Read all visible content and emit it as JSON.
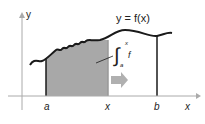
{
  "diagram": {
    "curve_label": "y = f(x)",
    "axis_y_label": "y",
    "axis_x_label": "x",
    "tick_a": "a",
    "tick_x": "x",
    "tick_b": "b",
    "integral": {
      "upper": "x",
      "lower": "a",
      "integrand": "f"
    },
    "colors": {
      "shade": "#a8a8a8",
      "arrow": "#b0b0b0",
      "axis": "#aaaaaa",
      "curve": "#1a1a1a"
    }
  }
}
